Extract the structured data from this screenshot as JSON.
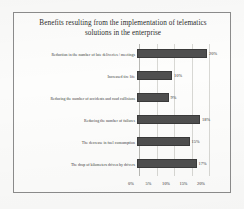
{
  "chart_data": {
    "type": "bar",
    "orientation": "horizontal",
    "title": "Benefits resulting from the implementation of telematics solutions in the enterprise",
    "title_lines": [
      "Benefits resulting from the implementation of telematics",
      "solutions in the enterprise"
    ],
    "xlabel": "",
    "ylabel": "",
    "categories": [
      "Reduction in the number of late deliveries / meetings",
      "Increased tire life",
      "Reducing the number of accidents and road collisions",
      "Reducing the number of failures",
      "The decrease in fuel consumption",
      "The drop of kilometers driven by drivers"
    ],
    "values": [
      20,
      10,
      9,
      18,
      15,
      17
    ],
    "value_labels": [
      "20%",
      "10%",
      "9%",
      "18%",
      "15%",
      "17%"
    ],
    "xlim": [
      0,
      22
    ],
    "xticks": [
      0,
      5,
      10,
      15,
      20
    ],
    "xtick_labels": [
      "0%",
      "5%",
      "10%",
      "15%",
      "20%"
    ],
    "grid": true,
    "legend": false,
    "bar_color": "#4f4f4f",
    "grid_color": "#d8d8d4",
    "text_color": "#2f2f2f",
    "frame_color": "#8c8c8c",
    "background_color": "#fdfdfc"
  }
}
